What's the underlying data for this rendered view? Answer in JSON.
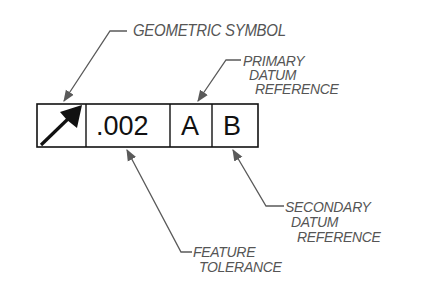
{
  "diagram": {
    "frame": {
      "cells": [
        {
          "name": "geometric-symbol",
          "symbol": "angularity-arrow"
        },
        {
          "name": "feature-tolerance",
          "text": ".002"
        },
        {
          "name": "primary-datum",
          "text": "A"
        },
        {
          "name": "secondary-datum",
          "text": "B"
        }
      ]
    },
    "callouts": {
      "geometric_symbol": {
        "lines": [
          "GEOMETRIC SYMBOL"
        ]
      },
      "primary_datum": {
        "lines": [
          "PRIMARY",
          "DATUM",
          "REFERENCE"
        ]
      },
      "secondary_datum": {
        "lines": [
          "SECONDARY",
          "DATUM",
          "REFERENCE"
        ]
      },
      "feature_tolerance": {
        "lines": [
          "FEATURE",
          "TOLERANCE"
        ]
      }
    },
    "colors": {
      "frame": "#111111",
      "leader": "#5a5a5a",
      "label": "#555555",
      "background": "#ffffff"
    }
  }
}
